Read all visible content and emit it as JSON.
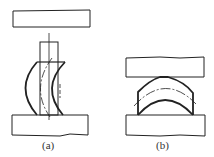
{
  "figure": {
    "panels": [
      {
        "id": "a",
        "label": "(a)",
        "description": "Bent column workpiece between top and bottom plates (buckling/barreling)"
      },
      {
        "id": "b",
        "label": "(b)",
        "description": "Arched workpiece between top and bottom plates"
      }
    ]
  },
  "colors": {
    "stroke": "#222222",
    "background": "#ffffff"
  }
}
